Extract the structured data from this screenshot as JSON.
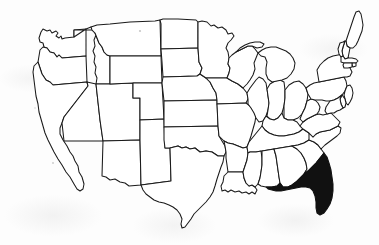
{
  "figure": {
    "title": "Map of the United States",
    "background_color": "#fdfdfd",
    "outline_color": "#1a1a1a",
    "highlight_color": "#111111",
    "unhighlighted_fill": "#ffffff",
    "style": "black and white line drawing, scanned",
    "highlighted_state": "Florida",
    "highlighted_state_count": 1,
    "state_count": 49,
    "labels_shown": "none",
    "legend_shown": "none",
    "caption": ""
  },
  "map": {
    "projection_hint": "conic, contiguous 48 states plus District of Columbia area",
    "viewbox": "0 0 379 245",
    "states": [
      {
        "name": "Washington",
        "abbr": "WA",
        "highlighted": false,
        "d": "M41,32 L43,29 L47,31 L50,30 L52,33 L56,31 L58,33 L56,36 L59,38 L61,36 L62,39 L65,38 L74,37 L74,30 L86,29 L86,56 L62,58 L59,55 L57,57 L54,53 L50,52 L47,48 L44,47 L43,43 L40,42 L39,38 Z"
      },
      {
        "name": "Oregon",
        "abbr": "OR",
        "highlighted": false,
        "d": "M39,56 L40,50 L43,47 L47,48 L50,52 L54,53 L57,57 L59,55 L62,58 L86,56 L87,82 L53,85 L50,82 L46,80 L42,74 L40,68 L38,62 Z"
      },
      {
        "name": "California",
        "abbr": "CA",
        "highlighted": false,
        "d": "M38,62 L40,68 L42,74 L46,80 L50,82 L53,85 L87,82 L88,86 L64,117 L62,123 L60,128 L60,134 L63,140 L67,146 L70,152 L73,156 L75,161 L78,166 L79,172 L82,177 L84,184 L83,189 L80,191 L77,189 L74,184 L70,177 L66,172 L62,165 L58,159 L54,152 L51,146 L48,140 L45,133 L43,126 L41,119 L39,112 L38,104 L36,96 L35,88 L34,80 L33,72 L34,66 Z"
      },
      {
        "name": "Idaho",
        "abbr": "ID",
        "highlighted": false,
        "d": "M74,30 L74,37 L86,29 L91,27 L95,30 L96,35 L94,40 L95,46 L93,51 L95,56 L94,62 L96,67 L95,73 L97,78 L96,84 L110,84 L110,56 L107,55 L104,52 L102,47 L99,43 L97,38 L95,33 L92,30 Z"
      },
      {
        "name": "Nevada",
        "abbr": "NV",
        "highlighted": false,
        "d": "M87,82 L96,84 L100,120 L103,141 L64,141 L62,123 L64,117 L88,86 Z"
      },
      {
        "name": "Utah",
        "abbr": "UT",
        "highlighted": false,
        "d": "M96,84 L110,84 L133,83 L133,98 L140,98 L140,140 L103,141 L100,120 Z"
      },
      {
        "name": "Arizona",
        "abbr": "AZ",
        "highlighted": false,
        "d": "M103,141 L140,140 L141,185 L129,186 L125,183 L120,182 L115,179 L110,180 L106,177 L102,176 Z"
      },
      {
        "name": "Montana",
        "abbr": "MT",
        "highlighted": false,
        "d": "M91,27 L97,25 L110,24 L130,22 L155,21 L160,20 L161,56 L110,56 L107,55 L104,52 L102,47 L99,43 L97,38 L95,33 L92,30 Z"
      },
      {
        "name": "Wyoming",
        "abbr": "WY",
        "highlighted": false,
        "d": "M110,56 L161,56 L162,83 L133,83 L110,84 Z"
      },
      {
        "name": "Colorado",
        "abbr": "CO",
        "highlighted": false,
        "d": "M133,83 L162,83 L164,119 L140,120 L140,98 L133,98 Z"
      },
      {
        "name": "New Mexico",
        "abbr": "NM",
        "highlighted": false,
        "d": "M140,120 L164,119 L165,148 L170,148 L171,181 L141,185 L140,140 Z"
      },
      {
        "name": "North Dakota",
        "abbr": "ND",
        "highlighted": false,
        "d": "M160,20 L163,19 L178,19 L196,20 L198,22 L198,48 L161,49 L161,24 Z"
      },
      {
        "name": "South Dakota",
        "abbr": "SD",
        "highlighted": false,
        "d": "M161,49 L198,48 L199,62 L202,68 L200,74 L197,76 L163,77 L162,62 Z"
      },
      {
        "name": "Nebraska",
        "abbr": "NE",
        "highlighted": false,
        "d": "M163,77 L197,76 L200,74 L206,78 L210,82 L213,88 L216,93 L217,100 L164,101 L162,83 Z"
      },
      {
        "name": "Kansas",
        "abbr": "KS",
        "highlighted": false,
        "d": "M164,101 L217,100 L218,126 L164,127 L164,119 Z"
      },
      {
        "name": "Oklahoma",
        "abbr": "OK",
        "highlighted": false,
        "d": "M164,127 L218,126 L219,136 L222,141 L225,146 L226,152 L224,156 L218,156 L212,152 L206,151 L200,152 L195,148 L190,149 L186,147 L182,148 L178,146 L174,147 L170,148 L165,148 L164,140 Z"
      },
      {
        "name": "Texas",
        "abbr": "TX",
        "highlighted": false,
        "d": "M170,148 L174,147 L178,146 L182,148 L186,147 L190,149 L195,148 L200,152 L206,151 L212,152 L218,156 L224,156 L223,162 L221,167 L219,173 L217,179 L215,186 L213,192 L210,197 L206,202 L202,206 L198,210 L194,214 L191,219 L188,223 L185,227 L182,228 L181,224 L182,219 L180,214 L177,210 L173,207 L169,205 L164,203 L159,202 L154,200 L150,197 L146,194 L143,190 L141,185 L171,181 Z"
      },
      {
        "name": "Minnesota",
        "abbr": "MN",
        "highlighted": false,
        "d": "M198,22 L202,21 L207,22 L211,26 L214,25 L218,28 L222,27 L226,30 L228,34 L232,33 L234,36 L231,40 L228,43 L226,48 L228,52 L229,58 L228,64 L230,68 L229,73 L227,78 L206,78 L200,74 L202,68 L199,62 L198,48 Z"
      },
      {
        "name": "Iowa",
        "abbr": "IA",
        "highlighted": false,
        "d": "M206,78 L227,78 L232,81 L238,84 L243,88 L247,93 L248,99 L246,103 L217,104 L217,100 L216,93 L213,88 L210,82 Z"
      },
      {
        "name": "Missouri",
        "abbr": "MO",
        "highlighted": false,
        "d": "M217,104 L246,103 L250,106 L253,110 L256,115 L255,122 L253,129 L251,136 L249,142 L247,147 L243,148 L238,146 L233,144 L228,143 L224,141 L219,136 L218,126 Z"
      },
      {
        "name": "Arkansas",
        "abbr": "AR",
        "highlighted": false,
        "d": "M224,141 L228,143 L233,144 L238,146 L243,148 L247,147 L248,153 L247,160 L245,166 L243,172 L228,172 L227,165 L226,158 L226,152 L225,146 Z"
      },
      {
        "name": "Louisiana",
        "abbr": "LA",
        "highlighted": false,
        "d": "M228,172 L243,172 L244,178 L246,183 L249,186 L252,185 L255,187 L257,190 L255,194 L252,192 L249,194 L246,192 L242,193 L239,191 L235,192 L231,190 L228,192 L225,190 L222,191 L221,186 L223,182 L224,176 Z"
      },
      {
        "name": "Wisconsin",
        "abbr": "WI",
        "highlighted": false,
        "d": "M229,58 L232,55 L236,52 L240,50 L244,48 L248,46 L252,46 L255,49 L258,53 L256,58 L254,63 L255,69 L253,75 L250,80 L247,84 L243,88 L238,84 L232,81 L227,78 L229,73 L230,68 L228,64 Z"
      },
      {
        "name": "Illinois",
        "abbr": "IL",
        "highlighted": false,
        "d": "M247,93 L250,88 L253,84 L256,80 L259,77 L263,79 L266,83 L267,89 L268,96 L269,103 L268,110 L266,116 L263,121 L259,122 L256,118 L254,113 L251,108 L248,104 L248,99 Z"
      },
      {
        "name": "Indiana",
        "abbr": "IN",
        "highlighted": false,
        "d": "M267,89 L270,84 L275,81 L280,80 L284,82 L285,90 L285,98 L284,106 L282,113 L278,118 L274,120 L270,119 L267,116 L268,110 L269,103 L268,96 Z"
      },
      {
        "name": "Ohio",
        "abbr": "OH",
        "highlighted": false,
        "d": "M285,90 L289,85 L294,82 L299,81 L303,84 L306,88 L308,94 L307,101 L305,108 L302,114 L298,118 L293,120 L288,120 L284,118 L284,106 L285,98 Z"
      },
      {
        "name": "Michigan",
        "abbr": "MI",
        "highlighted": false,
        "d": "M258,53 L262,50 L266,48 L271,47 L276,47 L281,49 L286,51 L290,54 L293,58 L295,63 L294,69 L291,74 L287,78 L282,80 L277,81 L272,82 L268,79 L266,74 L266,68 L267,62 L265,57 L261,56 Z M236,52 L240,48 L245,45 L250,43 L255,42 L260,42 L264,44 L262,47 L257,48 L252,46 L248,46 L244,48 L240,50 Z"
      },
      {
        "name": "Kentucky",
        "abbr": "KY",
        "highlighted": false,
        "d": "M263,121 L266,116 L270,119 L274,120 L278,118 L282,113 L284,118 L288,120 L293,120 L297,122 L300,126 L303,129 L299,132 L294,134 L289,135 L284,136 L279,136 L274,135 L269,133 L265,130 L262,126 Z"
      },
      {
        "name": "Tennessee",
        "abbr": "TN",
        "highlighted": false,
        "d": "M249,142 L262,126 L265,130 L269,133 L274,135 L279,136 L284,136 L289,135 L294,134 L299,132 L303,129 L309,133 L313,137 L309,140 L304,143 L298,145 L292,146 L286,147 L280,148 L274,149 L268,150 L262,151 L256,152 L250,152 L248,153 L247,147 Z"
      },
      {
        "name": "Mississippi",
        "abbr": "MS",
        "highlighted": false,
        "d": "M243,172 L245,166 L247,160 L248,153 L250,152 L256,152 L261,151 L262,158 L262,165 L261,172 L260,178 L258,184 L255,187 L252,185 L249,186 L246,183 L244,178 Z"
      },
      {
        "name": "Alabama",
        "abbr": "AL",
        "highlighted": false,
        "d": "M262,151 L268,150 L274,149 L276,156 L277,163 L278,170 L279,177 L280,183 L277,186 L272,187 L266,187 L261,186 L258,184 L260,178 L261,172 L262,165 L262,158 Z"
      },
      {
        "name": "Georgia",
        "abbr": "GA",
        "highlighted": false,
        "d": "M274,149 L280,148 L286,147 L292,146 L297,149 L301,153 L304,158 L306,163 L307,169 L304,174 L300,178 L296,182 L292,185 L288,187 L283,187 L280,183 L279,177 L278,170 L277,163 L276,156 Z"
      },
      {
        "name": "South Carolina",
        "abbr": "SC",
        "highlighted": false,
        "d": "M292,146 L298,145 L304,143 L309,140 L314,142 L318,145 L321,149 L324,153 L320,158 L316,163 L312,167 L308,171 L304,174 L307,169 L306,163 L304,158 L301,153 L297,149 Z"
      },
      {
        "name": "North Carolina",
        "abbr": "NC",
        "highlighted": false,
        "d": "M309,133 L313,137 L316,134 L320,132 L325,131 L330,130 L334,128 L338,126 L341,128 L340,133 L337,136 L333,139 L329,142 L325,145 L321,149 L318,145 L314,142 L309,140 Z"
      },
      {
        "name": "Virginia",
        "abbr": "VA",
        "highlighted": false,
        "d": "M300,126 L303,122 L307,119 L311,117 L315,115 L319,114 L323,115 L327,114 L331,113 L334,116 L337,119 L340,122 L338,126 L334,128 L330,130 L325,131 L320,132 L316,134 L313,137 L309,133 L303,129 Z"
      },
      {
        "name": "West Virginia",
        "abbr": "WV",
        "highlighted": false,
        "d": "M302,114 L305,108 L307,101 L311,99 L315,100 L318,103 L320,107 L319,111 L317,114 L315,115 L311,117 L307,119 L303,122 L300,119 Z"
      },
      {
        "name": "Pennsylvania",
        "abbr": "PA",
        "highlighted": false,
        "d": "M306,88 L310,85 L314,83 L319,82 L324,81 L329,80 L334,79 L339,78 L344,77 L346,81 L347,86 L345,91 L342,95 L338,98 L334,100 L330,101 L326,101 L322,100 L318,100 L315,100 L311,99 L308,94 Z"
      },
      {
        "name": "New York",
        "abbr": "NY",
        "highlighted": false,
        "d": "M319,82 L318,76 L317,70 L320,65 L324,61 L328,58 L333,56 L338,55 L343,54 L347,55 L349,59 L348,64 L350,68 L352,72 L350,76 L347,77 L344,77 L339,78 L334,79 L329,80 L324,81 Z"
      },
      {
        "name": "Maine",
        "abbr": "ME",
        "highlighted": false,
        "d": "M346,41 L348,35 L350,29 L352,23 L354,17 L356,12 L359,11 L361,14 L362,19 L363,25 L362,31 L360,36 L358,41 L356,45 L353,48 L350,48 L347,46 Z"
      },
      {
        "name": "New Hampshire",
        "abbr": "NH",
        "highlighted": false,
        "d": "M343,47 L345,41 L346,41 L347,46 L350,48 L349,53 L348,58 L345,59 L343,56 L342,51 Z"
      },
      {
        "name": "Vermont",
        "abbr": "VT",
        "highlighted": false,
        "d": "M338,49 L340,43 L343,42 L345,41 L343,47 L342,51 L343,56 L341,57 L339,54 Z"
      },
      {
        "name": "Massachusetts",
        "abbr": "MA",
        "highlighted": false,
        "d": "M343,56 L345,59 L348,58 L352,58 L356,59 L358,61 L356,63 L352,63 L348,63 L344,63 L341,62 L341,57 Z"
      },
      {
        "name": "Rhode Island",
        "abbr": "RI",
        "highlighted": false,
        "d": "M352,63 L356,63 L356,66 L353,67 L352,65 Z"
      },
      {
        "name": "Connecticut",
        "abbr": "CT",
        "highlighted": false,
        "d": "M344,63 L348,63 L352,63 L352,67 L348,68 L344,68 L343,65 Z"
      },
      {
        "name": "New Jersey",
        "abbr": "NJ",
        "highlighted": false,
        "d": "M345,91 L347,86 L350,85 L352,88 L353,93 L352,98 L350,102 L348,105 L346,103 L345,99 L344,95 Z"
      },
      {
        "name": "Delaware",
        "abbr": "DE",
        "highlighted": false,
        "d": "M342,95 L345,99 L346,103 L345,107 L343,108 L341,104 L340,99 Z"
      },
      {
        "name": "Maryland",
        "abbr": "MD",
        "highlighted": false,
        "d": "M330,101 L334,100 L338,98 L342,95 L340,99 L341,104 L343,108 L340,110 L337,111 L334,113 L331,113 L327,114 L325,111 L326,107 L328,104 Z"
      },
      {
        "name": "Florida",
        "abbr": "FL",
        "highlighted": true,
        "d": "M283,187 L288,187 L292,185 L296,182 L300,178 L304,174 L308,171 L312,167 L316,163 L320,158 L324,153 L327,157 L329,163 L331,170 L332,177 L333,184 L333,191 L332,198 L330,204 L327,209 L324,213 L320,215 L317,213 L316,208 L316,202 L315,196 L313,191 L310,188 L306,187 L301,187 L296,188 L291,189 L286,190 L281,191 L276,191 L272,190 L268,189 L266,187 L272,187 L277,186 L280,183 Z"
      }
    ]
  },
  "artifacts": {
    "description": "faint scanner specks on the paper background",
    "specks": [
      {
        "x": 140,
        "y": 31,
        "r": 1.1
      },
      {
        "x": 53,
        "y": 163,
        "r": 0.9
      },
      {
        "x": 35,
        "y": 108,
        "r": 0.7
      }
    ]
  }
}
